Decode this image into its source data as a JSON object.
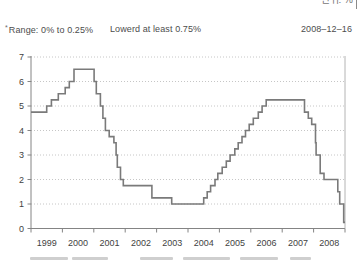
{
  "annotations": {
    "footnote_marker": "*",
    "range_note": "Range: 0% to 0.25%",
    "lowered_note": "Lowerd at least 0.75%",
    "date": "2008–12–16"
  },
  "corner": {
    "cropped_text": "단위: %"
  },
  "colors": {
    "line": "#7a7a7a",
    "axis": "#848484",
    "grid": "#c6c6c6",
    "tick_label": "#3f3f3f",
    "right_border": "#b4b4b4"
  },
  "chart_data": {
    "type": "line",
    "subtype": "step-after",
    "title": "",
    "xlabel": "",
    "ylabel": "",
    "xlim": [
      1999,
      2009
    ],
    "ylim": [
      0,
      7
    ],
    "grid": "horizontal-dotted",
    "legend": "none",
    "yticks": [
      0,
      1,
      2,
      3,
      4,
      5,
      6,
      7
    ],
    "x_year_labels": [
      "1999",
      "2000",
      "2001",
      "2002",
      "2003",
      "2004",
      "2005",
      "2006",
      "2007",
      "2008"
    ],
    "series": [
      {
        "points": [
          [
            1999.0,
            4.75
          ],
          [
            1999.5,
            5.0
          ],
          [
            1999.65,
            5.25
          ],
          [
            1999.87,
            5.5
          ],
          [
            2000.09,
            5.75
          ],
          [
            2000.22,
            6.0
          ],
          [
            2000.37,
            6.5
          ],
          [
            2001.01,
            6.0
          ],
          [
            2001.08,
            5.5
          ],
          [
            2001.21,
            5.0
          ],
          [
            2001.29,
            4.5
          ],
          [
            2001.37,
            4.0
          ],
          [
            2001.49,
            3.75
          ],
          [
            2001.64,
            3.5
          ],
          [
            2001.71,
            3.0
          ],
          [
            2001.75,
            2.5
          ],
          [
            2001.85,
            2.0
          ],
          [
            2001.94,
            1.75
          ],
          [
            2002.85,
            1.25
          ],
          [
            2003.48,
            1.0
          ],
          [
            2004.5,
            1.25
          ],
          [
            2004.61,
            1.5
          ],
          [
            2004.72,
            1.75
          ],
          [
            2004.86,
            2.0
          ],
          [
            2004.95,
            2.25
          ],
          [
            2005.09,
            2.5
          ],
          [
            2005.22,
            2.75
          ],
          [
            2005.34,
            3.0
          ],
          [
            2005.49,
            3.25
          ],
          [
            2005.6,
            3.5
          ],
          [
            2005.72,
            3.75
          ],
          [
            2005.83,
            4.0
          ],
          [
            2005.95,
            4.25
          ],
          [
            2006.08,
            4.5
          ],
          [
            2006.24,
            4.75
          ],
          [
            2006.36,
            5.0
          ],
          [
            2006.49,
            5.25
          ],
          [
            2007.71,
            4.75
          ],
          [
            2007.83,
            4.5
          ],
          [
            2007.94,
            4.25
          ],
          [
            2008.06,
            3.5
          ],
          [
            2008.08,
            3.0
          ],
          [
            2008.21,
            2.25
          ],
          [
            2008.33,
            2.0
          ],
          [
            2008.77,
            1.5
          ],
          [
            2008.83,
            1.0
          ],
          [
            2008.96,
            0.25
          ]
        ]
      }
    ]
  },
  "cropped_bottom_fragments": [
    {
      "x": 30,
      "w": 38
    },
    {
      "x": 72,
      "w": 36
    },
    {
      "x": 140,
      "w": 33
    },
    {
      "x": 183,
      "w": 47
    },
    {
      "x": 240,
      "w": 38
    },
    {
      "x": 290,
      "w": 21
    }
  ]
}
